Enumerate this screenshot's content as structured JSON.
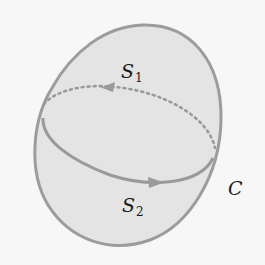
{
  "figure": {
    "colors": {
      "background": "#f7f7f7",
      "surface_fill": "#e4e4e4",
      "outline": "#9c9c9c",
      "curve": "#9a9a9a",
      "text": "#1a1a1a"
    },
    "labels": {
      "s1": {
        "base": "S",
        "sub": "1"
      },
      "s2": {
        "base": "S",
        "sub": "2"
      },
      "c": {
        "base": "C"
      }
    },
    "curve": {
      "front_style": "solid",
      "back_style": "dotted",
      "back_arrow_direction": "left",
      "front_arrow_direction": "right"
    }
  }
}
